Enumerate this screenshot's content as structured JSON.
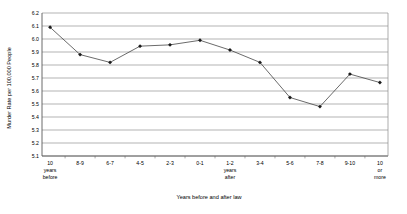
{
  "chart_data": {
    "type": "line",
    "title": "",
    "xlabel": "Years before and after law",
    "ylabel": "Murder Rate per 100,000 People",
    "ylim": [
      5.1,
      6.2
    ],
    "ytick_step": 0.1,
    "yticks": [
      "6.2",
      "6.1",
      "6.0",
      "5.9",
      "5.8",
      "5.7",
      "5.6",
      "5.5",
      "5.4",
      "5.3",
      "5.2",
      "5.1"
    ],
    "grid": true,
    "legend": null,
    "legend_position": "none",
    "series_name": "Murder rate",
    "categories": [
      "10 years before",
      "8-9",
      "6-7",
      "4-5",
      "2-3",
      "0-1",
      "1-2 years after",
      "3-4",
      "5-6",
      "7-8",
      "9-10",
      "10 or more"
    ],
    "category_lines": [
      [
        "10",
        "years",
        "before"
      ],
      [
        "8-9"
      ],
      [
        "6-7"
      ],
      [
        "4-5"
      ],
      [
        "2-3"
      ],
      [
        "0-1"
      ],
      [
        "1-2",
        "years",
        "after"
      ],
      [
        "3-4"
      ],
      [
        "5-6"
      ],
      [
        "7-8"
      ],
      [
        "9-10"
      ],
      [
        "10",
        "or",
        "more"
      ]
    ],
    "values": [
      6.09,
      5.88,
      5.82,
      5.945,
      5.955,
      5.99,
      5.915,
      5.82,
      5.55,
      5.48,
      5.73,
      5.665
    ],
    "marker": "diamond",
    "line_color": "#3a3a3a",
    "marker_color": "#1a1a1a",
    "grid_color": "#808080",
    "background_color": "#ffffff"
  },
  "caption": {
    "text": ""
  }
}
